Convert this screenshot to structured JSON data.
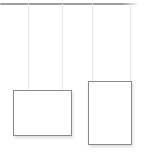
{
  "illustration": {
    "name": "empty-gallery-hanging-frames",
    "colors": {
      "background": "#ffffff",
      "rail": "#a0a0a0",
      "wire": "#e7e7e7",
      "frame_border": "#8a8a8a",
      "frame_fill": "#ffffff"
    },
    "rail": {
      "x": 0,
      "y": 3,
      "width": 139,
      "height": 1.5
    },
    "wires": [
      {
        "x": 28,
        "top": 4,
        "bottom": 90
      },
      {
        "x": 62,
        "top": 4,
        "bottom": 90
      },
      {
        "x": 92,
        "top": 4,
        "bottom": 81
      },
      {
        "x": 130,
        "top": 4,
        "bottom": 81
      }
    ],
    "frames": [
      {
        "orientation": "landscape",
        "x": 13,
        "y": 90,
        "width": 59,
        "height": 46
      },
      {
        "orientation": "portrait",
        "x": 88,
        "y": 81,
        "width": 44,
        "height": 64
      }
    ]
  }
}
